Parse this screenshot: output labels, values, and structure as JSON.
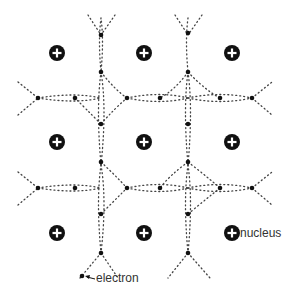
{
  "diagram": {
    "colors": {
      "ink": "#111111",
      "dots": "#444444",
      "text": "#333333",
      "background": "#ffffff"
    },
    "nucleus_symbol": "+",
    "nuclei_grid": {
      "rows": 3,
      "cols": 3
    },
    "labels": {
      "nucleus": "nucleus",
      "electron": "electron"
    }
  }
}
